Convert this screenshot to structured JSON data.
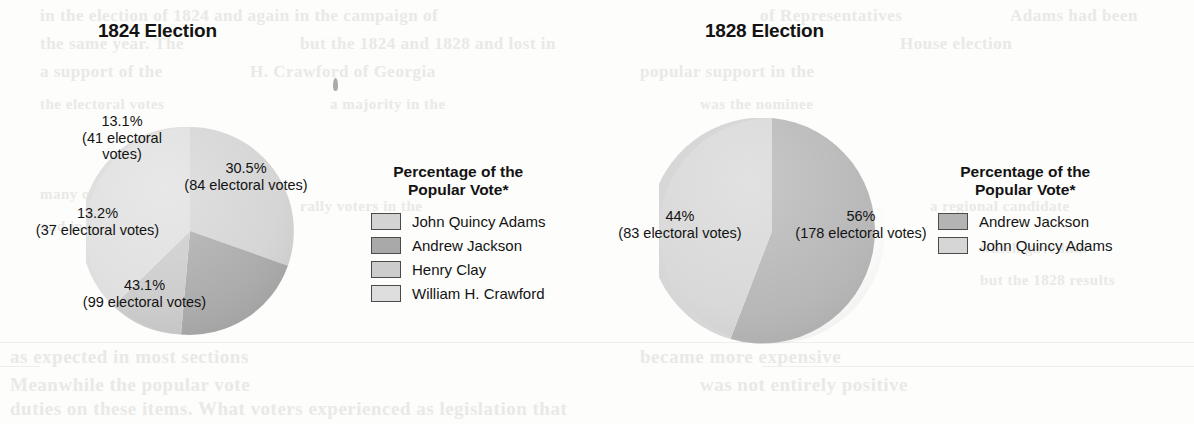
{
  "page": {
    "background_color": "#fdfdfc",
    "ghost_text": [
      {
        "text": "in the election of 1824 and again in the campaign of",
        "x": 40,
        "y": 6,
        "size": 17
      },
      {
        "text": "of Representatives",
        "x": 760,
        "y": 6,
        "size": 17
      },
      {
        "text": "Adams had been",
        "x": 1010,
        "y": 6,
        "size": 17
      },
      {
        "text": "the same year. The",
        "x": 40,
        "y": 34,
        "size": 17
      },
      {
        "text": "but the 1824 and 1828 and lost in",
        "x": 300,
        "y": 34,
        "size": 17
      },
      {
        "text": "House election",
        "x": 900,
        "y": 34,
        "size": 17
      },
      {
        "text": "a support of the",
        "x": 40,
        "y": 62,
        "size": 17
      },
      {
        "text": "H. Crawford of Georgia",
        "x": 250,
        "y": 62,
        "size": 17
      },
      {
        "text": "popular support in the",
        "x": 640,
        "y": 62,
        "size": 17
      },
      {
        "text": "the electoral votes",
        "x": 40,
        "y": 96,
        "size": 15
      },
      {
        "text": "a majority in the",
        "x": 330,
        "y": 96,
        "size": 15
      },
      {
        "text": "was the nominee",
        "x": 700,
        "y": 96,
        "size": 15
      },
      {
        "text": "many of the",
        "x": 40,
        "y": 186,
        "size": 15
      },
      {
        "text": "rally voters in the",
        "x": 300,
        "y": 198,
        "size": 15
      },
      {
        "text": "a regional candidate",
        "x": 930,
        "y": 198,
        "size": 15
      },
      {
        "text": "and in the election",
        "x": 40,
        "y": 218,
        "size": 15
      },
      {
        "text": "which gave him",
        "x": 980,
        "y": 240,
        "size": 15
      },
      {
        "text": "but the 1828 results",
        "x": 980,
        "y": 272,
        "size": 15
      },
      {
        "text": "as expected in most sections",
        "x": 10,
        "y": 346,
        "size": 19
      },
      {
        "text": "Meanwhile the popular vote",
        "x": 10,
        "y": 374,
        "size": 19
      },
      {
        "text": "duties on these items. What voters experienced as legislation that",
        "x": 10,
        "y": 398,
        "size": 19
      },
      {
        "text": "became more expensive",
        "x": 640,
        "y": 346,
        "size": 19
      },
      {
        "text": "was not entirely positive",
        "x": 700,
        "y": 374,
        "size": 19
      }
    ],
    "specks": [
      {
        "x": 333,
        "y": 78,
        "w": 5,
        "h": 13
      },
      {
        "x": 832,
        "y": 148,
        "w": 3,
        "h": 8
      }
    ],
    "scan_rules": [
      {
        "x": 0,
        "y": 342,
        "w": 1194
      },
      {
        "x": 0,
        "y": 366,
        "w": 40
      },
      {
        "x": 762,
        "y": 366,
        "w": 432
      }
    ]
  },
  "charts": [
    {
      "id": "election-1824",
      "title": "1824 Election",
      "title_x": 98,
      "title_y": 20,
      "pie": {
        "cx": 190,
        "cy": 231,
        "r": 104
      },
      "legend": {
        "x": 371,
        "y": 163,
        "title_line1": "Percentage of the",
        "title_line2": "Popular Vote*",
        "items": [
          {
            "label": "John Quincy Adams",
            "color": "#d3d3d3"
          },
          {
            "label": "Andrew Jackson",
            "color": "#a9a9a9"
          },
          {
            "label": "Henry Clay",
            "color": "#cccccc"
          },
          {
            "label": "William H. Crawford",
            "color": "#dedede"
          }
        ]
      },
      "chart_data": {
        "type": "pie",
        "title": "1824 Election",
        "legend_title": "Percentage of the Popular Vote*",
        "legend_position": "right",
        "unit": "percent of popular vote",
        "start_angle_deg": 0,
        "direction": "clockwise",
        "slices": [
          {
            "name": "John Quincy Adams",
            "value": 30.5,
            "label_pct": "30.5%",
            "label_votes": "(84 electoral votes)",
            "electoral_votes": 84,
            "color": "#d3d3d3",
            "label_x": 243,
            "label_y": 168
          },
          {
            "name": "Andrew Jackson",
            "value": 43.1,
            "label_pct": "43.1%",
            "label_votes": "(99 electoral votes)",
            "electoral_votes": 99,
            "color": "#a9a9a9",
            "label_x": 137,
            "label_y": 283
          },
          {
            "name": "Henry Clay",
            "value": 13.2,
            "label_pct": "13.2%",
            "label_votes": "(37 electoral votes)",
            "electoral_votes": 37,
            "color": "#cccccc",
            "label_x": 22,
            "label_y": 212
          },
          {
            "name": "William H. Crawford",
            "value": 13.1,
            "label_pct": "13.1%",
            "label_votes": "(41 electoral\nvotes)",
            "electoral_votes": 41,
            "color": "#dedede",
            "label_x": 104,
            "label_y": 118
          }
        ]
      }
    },
    {
      "id": "election-1828",
      "title": "1828 Election",
      "title_x": 705,
      "title_y": 20,
      "pie": {
        "cx": 772,
        "cy": 231,
        "r": 113
      },
      "legend": {
        "x": 938,
        "y": 163,
        "title_line1": "Percentage of the",
        "title_line2": "Popular Vote*",
        "items": [
          {
            "label": "Andrew Jackson",
            "color": "#b4b4b4"
          },
          {
            "label": "John Quincy Adams",
            "color": "#d6d6d6"
          }
        ]
      },
      "chart_data": {
        "type": "pie",
        "title": "1828 Election",
        "legend_title": "Percentage of the Popular Vote*",
        "legend_position": "right",
        "unit": "percent of popular vote",
        "start_angle_deg": 0,
        "direction": "clockwise",
        "slices": [
          {
            "name": "Andrew Jackson",
            "value": 56,
            "label_pct": "56%",
            "label_votes": "(178 electoral votes)",
            "electoral_votes": 178,
            "color": "#b4b4b4",
            "label_x": 790,
            "label_y": 216
          },
          {
            "name": "John Quincy Adams",
            "value": 44,
            "label_pct": "44%",
            "label_votes": "(83 electoral votes)",
            "electoral_votes": 83,
            "color": "#d6d6d6",
            "label_x": 607,
            "label_y": 216
          }
        ]
      }
    }
  ]
}
